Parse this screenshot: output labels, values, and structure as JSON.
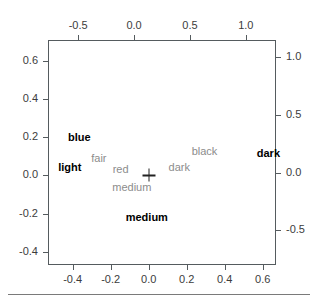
{
  "chart_data": {
    "type": "scatter",
    "title": "",
    "subtitle": "",
    "xlabel": "",
    "ylabel": "",
    "axes": {
      "bottom": {
        "name": "row-principal-coordinates-dim1",
        "ticks": [
          "-0.4",
          "-0.2",
          "0.0",
          "0.2",
          "0.4",
          "0.6"
        ],
        "values": [
          -0.4,
          -0.2,
          0.0,
          0.2,
          0.4,
          0.6
        ],
        "range": [
          -0.53,
          0.67
        ]
      },
      "left": {
        "name": "row-principal-coordinates-dim2",
        "ticks": [
          "0.6",
          "0.4",
          "0.2",
          "0.0",
          "-0.2",
          "-0.4"
        ],
        "values": [
          0.6,
          0.4,
          0.2,
          0.0,
          -0.2,
          -0.4
        ],
        "range": [
          -0.47,
          0.71
        ]
      },
      "top": {
        "name": "column-standard-coordinates-dim1",
        "ticks": [
          "-0.5",
          "0.0",
          "0.5",
          "1.0"
        ],
        "values": [
          -0.5,
          0.0,
          0.5,
          1.0
        ],
        "range": [
          -0.77,
          1.27
        ]
      },
      "right": {
        "name": "column-standard-coordinates-dim2",
        "ticks": [
          "1.0",
          "0.5",
          "0.0",
          "-0.5"
        ],
        "values": [
          1.0,
          0.5,
          0.0,
          -0.5
        ],
        "range": [
          -0.8,
          1.15
        ]
      },
      "grid": false
    },
    "legend": null,
    "origin_marker": {
      "label": "+",
      "x": 0.0,
      "y": 0.0
    },
    "series": [
      {
        "name": "rows",
        "style": "bold-black-text",
        "color": "#000000",
        "points": [
          {
            "label": "blue",
            "x": -0.365,
            "y": 0.2
          },
          {
            "label": "light",
            "x": -0.415,
            "y": 0.043
          },
          {
            "label": "medium",
            "x": -0.01,
            "y": -0.218
          },
          {
            "label": "dark",
            "x": 0.63,
            "y": 0.117
          }
        ]
      },
      {
        "name": "columns",
        "style": "gray-text",
        "color": "#8c8c8c",
        "points": [
          {
            "label": "fair",
            "x": -0.315,
            "y": 0.128
          },
          {
            "label": "red",
            "x": -0.12,
            "y": 0.028
          },
          {
            "label": "medium",
            "x": -0.02,
            "y": -0.125
          },
          {
            "label": "dark",
            "x": 0.405,
            "y": 0.05
          },
          {
            "label": "black",
            "x": 0.63,
            "y": 0.185
          }
        ]
      }
    ]
  }
}
